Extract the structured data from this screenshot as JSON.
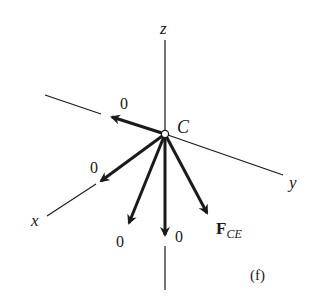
{
  "figure": {
    "panel_label": "(f)",
    "node": {
      "label": "C"
    },
    "axes": {
      "x": {
        "label": "x"
      },
      "y": {
        "label": "y"
      },
      "z": {
        "label": "z"
      }
    },
    "forces": [
      {
        "id": "force-back-x",
        "label": "0",
        "direction": "negative x (back-left)"
      },
      {
        "id": "force-front-x",
        "label": "0",
        "direction": "along +x"
      },
      {
        "id": "force-down-left",
        "label": "0",
        "direction": "down-left"
      },
      {
        "id": "force-down",
        "label": "0",
        "direction": "negative z"
      },
      {
        "id": "force-ce",
        "label_main": "F",
        "label_sub": "CE",
        "direction": "down-right"
      }
    ],
    "colors": {
      "ink": "#1a1a1a",
      "background": "#ffffff"
    }
  }
}
